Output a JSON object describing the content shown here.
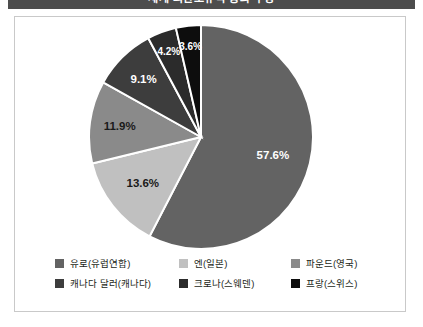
{
  "header": {
    "title": "세계 외환보유액 통화 구성"
  },
  "chart_data": {
    "type": "pie",
    "title": "세계 외환보유액 통화 구성",
    "unit": "%",
    "legend_position": "bottom",
    "start_angle_deg": 0,
    "direction": "clockwise",
    "categories": [
      "유로(유럽연합)",
      "엔(일본)",
      "파운드(영국)",
      "캐나다 달러(캐나다)",
      "크로나(스웨덴)",
      "프랑(스위스)"
    ],
    "values": [
      57.6,
      13.6,
      11.9,
      9.1,
      4.2,
      3.6
    ],
    "labels": [
      "57.6%",
      "13.6%",
      "11.9%",
      "9.1%",
      "4.2%",
      "3.6%"
    ],
    "colors": [
      "#636363",
      "#c0c0c0",
      "#8a8a8a",
      "#3d3d3d",
      "#2b2b2b",
      "#0d0d0d"
    ],
    "slice_border_color": "#ffffff",
    "total": 100.0
  },
  "slices": [
    {
      "label": "57.6%",
      "value": 57.6,
      "color": "#636363",
      "label_color": "light"
    },
    {
      "label": "13.6%",
      "value": 13.6,
      "color": "#c0c0c0",
      "label_color": "dark"
    },
    {
      "label": "11.9%",
      "value": 11.9,
      "color": "#8a8a8a",
      "label_color": "dark"
    },
    {
      "label": "9.1%",
      "value": 9.1,
      "color": "#3d3d3d",
      "label_color": "light"
    },
    {
      "label": "4.2%",
      "value": 4.2,
      "color": "#2b2b2b",
      "label_color": "light"
    },
    {
      "label": "3.6%",
      "value": 3.6,
      "color": "#0d0d0d",
      "label_color": "light"
    }
  ],
  "legend": {
    "rows": [
      [
        {
          "label": "유로(유럽연합)",
          "color": "#636363"
        },
        {
          "label": "엔(일본)",
          "color": "#c0c0c0"
        },
        {
          "label": "파운드(영국)",
          "color": "#8a8a8a"
        }
      ],
      [
        {
          "label": "캐나다 달러(캐나다)",
          "color": "#3d3d3d"
        },
        {
          "label": "크로나(스웨덴)",
          "color": "#2b2b2b"
        },
        {
          "label": "프랑(스위스)",
          "color": "#0d0d0d"
        }
      ]
    ]
  }
}
